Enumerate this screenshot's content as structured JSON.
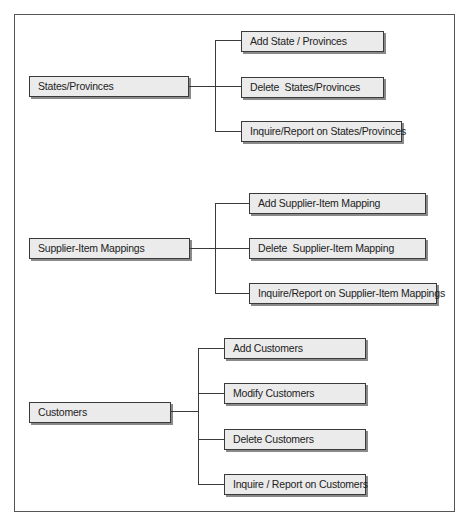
{
  "diagram": {
    "type": "menu-hierarchy",
    "colors": {
      "box_fill": "#ebebeb",
      "box_border": "#3a3a3a",
      "box_shadow": "#8a8a8a",
      "connector": "#3a3a3a",
      "frame": "#555555"
    },
    "groups": [
      {
        "label": "States/Provinces",
        "children": [
          {
            "label": "Add State / Provinces"
          },
          {
            "label": "Delete  States/Provinces"
          },
          {
            "label": "Inquire/Report on States/Provinces"
          }
        ]
      },
      {
        "label": "Supplier-Item Mappings",
        "children": [
          {
            "label": "Add Supplier-Item Mapping"
          },
          {
            "label": "Delete  Supplier-Item Mapping"
          },
          {
            "label": "Inquire/Report on Supplier-Item Mappings"
          }
        ]
      },
      {
        "label": "Customers",
        "children": [
          {
            "label": "Add Customers"
          },
          {
            "label": "Modify Customers"
          },
          {
            "label": "Delete Customers"
          },
          {
            "label": "Inquire / Report on Customers"
          }
        ]
      }
    ]
  }
}
